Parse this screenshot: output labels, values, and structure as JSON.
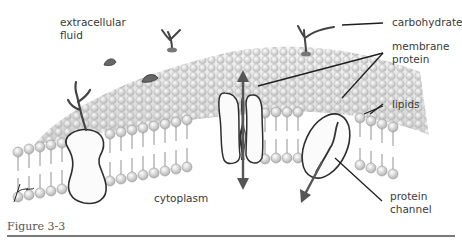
{
  "figure": {
    "caption": "Figure 3-3",
    "labels": {
      "extracellular": [
        "extracellular",
        "fluid"
      ],
      "carbohydrate": "carbohydrate",
      "membrane_protein": [
        "membrane",
        "protein"
      ],
      "lipids": "lipids",
      "cytoplasm": "cytoplasm",
      "protein_channel": [
        "protein",
        "channel"
      ]
    }
  },
  "colors": {
    "background": "#ffffff",
    "surface": "#d9d9d9",
    "lipid_head": "#e6e6e6",
    "outline": "#333333",
    "text": "#3a3a3a",
    "rule": "#7a7a7a"
  }
}
